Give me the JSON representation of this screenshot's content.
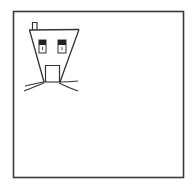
{
  "drawing": {
    "subject": "house",
    "style": "hand-drawn line sketch",
    "stroke_color": "#333333",
    "background_color": "#ffffff",
    "frame": {
      "x": 13,
      "y": 11,
      "width": 171,
      "height": 167
    },
    "elements": [
      "frame-border",
      "chimney",
      "roof-line",
      "house-walls",
      "left-window",
      "right-window",
      "door",
      "ground-lines"
    ]
  }
}
